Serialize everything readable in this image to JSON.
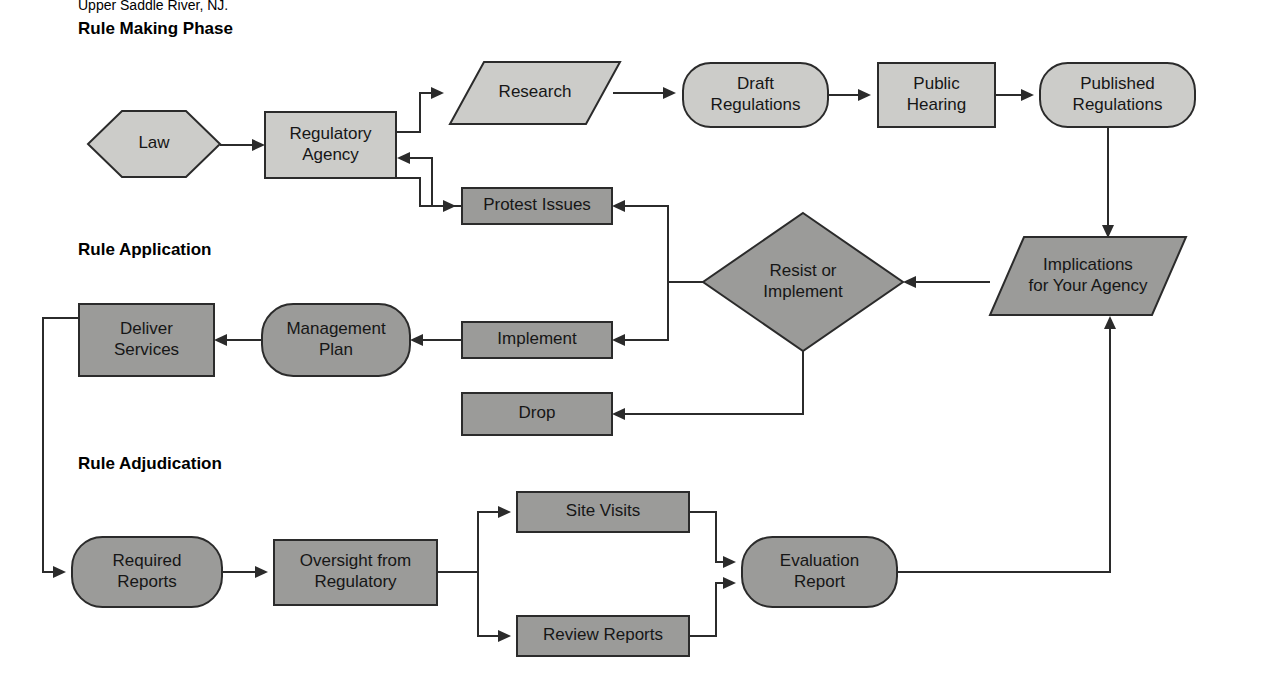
{
  "document": {
    "citation_line": "Upper Saddle River, NJ."
  },
  "sections": [
    {
      "id": "rule-making-phase",
      "label": "Rule Making Phase",
      "x": 78,
      "y": 34
    },
    {
      "id": "rule-application",
      "label": "Rule Application",
      "x": 78,
      "y": 255
    },
    {
      "id": "rule-adjudication",
      "label": "Rule Adjudication",
      "x": 78,
      "y": 469
    }
  ],
  "colors": {
    "fill_light": "#ccccc9",
    "fill_dark": "#9b9b99",
    "stroke": "#2b2b2b",
    "text": "#161616",
    "background": "#ffffff"
  },
  "nodes": [
    {
      "id": "law",
      "label": "Law",
      "lines": [
        "Law"
      ],
      "shape": "hexagon",
      "tone": "light",
      "x": 88,
      "y": 111,
      "w": 132,
      "h": 66
    },
    {
      "id": "regulatory-agency",
      "label": "Regulatory Agency",
      "lines": [
        "Regulatory",
        "Agency"
      ],
      "shape": "rect",
      "tone": "light",
      "x": 265,
      "y": 112,
      "w": 131,
      "h": 66
    },
    {
      "id": "research",
      "label": "Research",
      "lines": [
        "Research"
      ],
      "shape": "parallelogram",
      "tone": "light",
      "x": 450,
      "y": 62,
      "w": 170,
      "h": 62
    },
    {
      "id": "draft-regulations",
      "label": "Draft Regulations",
      "lines": [
        "Draft",
        "Regulations"
      ],
      "shape": "stadium",
      "tone": "light",
      "x": 683,
      "y": 63,
      "w": 145,
      "h": 64
    },
    {
      "id": "public-hearing",
      "label": "Public Hearing",
      "lines": [
        "Public",
        "Hearing"
      ],
      "shape": "rect",
      "tone": "light",
      "x": 878,
      "y": 63,
      "w": 117,
      "h": 64
    },
    {
      "id": "published-regulations",
      "label": "Published Regulations",
      "lines": [
        "Published",
        "Regulations"
      ],
      "shape": "stadium",
      "tone": "light",
      "x": 1040,
      "y": 63,
      "w": 155,
      "h": 64
    },
    {
      "id": "protest-issues",
      "label": "Protest Issues",
      "lines": [
        "Protest Issues"
      ],
      "shape": "rect",
      "tone": "dark",
      "x": 462,
      "y": 188,
      "w": 150,
      "h": 36
    },
    {
      "id": "resist-or-implement",
      "label": "Resist or Implement",
      "lines": [
        "Resist or",
        "Implement"
      ],
      "shape": "diamond",
      "tone": "dark",
      "x": 703,
      "y": 213,
      "w": 200,
      "h": 138
    },
    {
      "id": "implications",
      "label": "Implications for Your Agency",
      "lines": [
        "Implications",
        "for Your Agency"
      ],
      "shape": "parallelogram",
      "tone": "dark",
      "x": 990,
      "y": 237,
      "w": 196,
      "h": 78
    },
    {
      "id": "implement",
      "label": "Implement",
      "lines": [
        "Implement"
      ],
      "shape": "rect",
      "tone": "dark",
      "x": 462,
      "y": 322,
      "w": 150,
      "h": 36
    },
    {
      "id": "management-plan",
      "label": "Management Plan",
      "lines": [
        "Management",
        "Plan"
      ],
      "shape": "stadium",
      "tone": "dark",
      "x": 262,
      "y": 304,
      "w": 148,
      "h": 72
    },
    {
      "id": "deliver-services",
      "label": "Deliver Services",
      "lines": [
        "Deliver",
        "Services"
      ],
      "shape": "rect",
      "tone": "dark",
      "x": 79,
      "y": 304,
      "w": 135,
      "h": 72
    },
    {
      "id": "drop",
      "label": "Drop",
      "lines": [
        "Drop"
      ],
      "shape": "rect",
      "tone": "dark",
      "x": 462,
      "y": 393,
      "w": 150,
      "h": 42
    },
    {
      "id": "required-reports",
      "label": "Required Reports",
      "lines": [
        "Required",
        "Reports"
      ],
      "shape": "stadium",
      "tone": "dark",
      "x": 72,
      "y": 537,
      "w": 150,
      "h": 70
    },
    {
      "id": "oversight-regulatory",
      "label": "Oversight from Regulatory",
      "lines": [
        "Oversight from",
        "Regulatory"
      ],
      "shape": "rect",
      "tone": "dark",
      "x": 274,
      "y": 540,
      "w": 163,
      "h": 65
    },
    {
      "id": "site-visits",
      "label": "Site Visits",
      "lines": [
        "Site Visits"
      ],
      "shape": "rect",
      "tone": "dark",
      "x": 517,
      "y": 492,
      "w": 172,
      "h": 40
    },
    {
      "id": "review-reports",
      "label": "Review Reports",
      "lines": [
        "Review Reports"
      ],
      "shape": "rect",
      "tone": "dark",
      "x": 517,
      "y": 616,
      "w": 172,
      "h": 40
    },
    {
      "id": "evaluation-report",
      "label": "Evaluation Report",
      "lines": [
        "Evaluation",
        "Report"
      ],
      "shape": "stadium",
      "tone": "dark",
      "x": 742,
      "y": 537,
      "w": 155,
      "h": 70
    }
  ],
  "edges": [
    {
      "id": "law-to-agency",
      "from": "law",
      "to": "regulatory-agency",
      "path": "M 220 145 L 257 145",
      "arrow": "right",
      "ax": 265,
      "ay": 145
    },
    {
      "id": "agency-to-research",
      "from": "regulatory-agency",
      "to": "research",
      "path": "M 396 132 L 420 132 L 420 93 L 435 93",
      "arrow": "right",
      "ax": 444,
      "ay": 93
    },
    {
      "id": "research-to-draft",
      "from": "research",
      "to": "draft-regulations",
      "path": "M 613 93 L 667 93",
      "arrow": "right",
      "ax": 676,
      "ay": 93
    },
    {
      "id": "draft-to-hearing",
      "from": "draft-regulations",
      "to": "public-hearing",
      "path": "M 828 95 L 862 95",
      "arrow": "right",
      "ax": 871,
      "ay": 95
    },
    {
      "id": "hearing-to-published",
      "from": "public-hearing",
      "to": "published-regulations",
      "path": "M 995 95 L 1025 95",
      "arrow": "right",
      "ax": 1034,
      "ay": 95
    },
    {
      "id": "published-to-implications",
      "from": "published-regulations",
      "to": "implications",
      "path": "M 1108 127 L 1108 229",
      "arrow": "down",
      "ax": 1108,
      "ay": 238
    },
    {
      "id": "agency-to-protest",
      "from": "regulatory-agency",
      "to": "protest-issues",
      "path": "M 396 178 L 420 178 L 420 206 L 447 206",
      "arrow": "right",
      "ax": 456,
      "ay": 206
    },
    {
      "id": "protest-to-agency",
      "from": "protest-issues",
      "to": "regulatory-agency",
      "path": "M 462 206 L 432 206 L 432 158 L 406 158",
      "arrow": "left",
      "ax": 397,
      "ay": 158
    },
    {
      "id": "implications-to-diamond",
      "from": "implications",
      "to": "resist-or-implement",
      "path": "M 990 282 L 912 282",
      "arrow": "left",
      "ax": 903,
      "ay": 282
    },
    {
      "id": "diamond-to-protest",
      "from": "resist-or-implement",
      "to": "protest-issues",
      "path": "M 703 282 L 668 282 L 668 206 L 621 206",
      "arrow": "left",
      "ax": 612,
      "ay": 206
    },
    {
      "id": "diamond-to-implement",
      "from": "resist-or-implement",
      "to": "implement",
      "path": "M 668 282 L 668 340 L 621 340",
      "arrow": "left",
      "ax": 612,
      "ay": 340
    },
    {
      "id": "diamond-to-drop",
      "from": "resist-or-implement",
      "to": "drop",
      "path": "M 803 351 L 803 414 L 621 414",
      "arrow": "left",
      "ax": 612,
      "ay": 414
    },
    {
      "id": "implement-to-management",
      "from": "implement",
      "to": "management-plan",
      "path": "M 462 340 L 419 340",
      "arrow": "left",
      "ax": 410,
      "ay": 340
    },
    {
      "id": "management-to-deliver",
      "from": "management-plan",
      "to": "deliver-services",
      "path": "M 262 340 L 223 340",
      "arrow": "left",
      "ax": 214,
      "ay": 340
    },
    {
      "id": "deliver-to-required",
      "from": "deliver-services",
      "to": "required-reports",
      "path": "M 79 318 L 43 318 L 43 572 L 57 572",
      "arrow": "right",
      "ax": 66,
      "ay": 572
    },
    {
      "id": "required-to-oversight",
      "from": "required-reports",
      "to": "oversight-regulatory",
      "path": "M 222 572 L 259 572",
      "arrow": "right",
      "ax": 268,
      "ay": 572
    },
    {
      "id": "oversight-to-site-visits",
      "from": "oversight-regulatory",
      "to": "site-visits",
      "path": "M 437 572 L 478 572 L 478 512 L 502 512",
      "arrow": "right",
      "ax": 511,
      "ay": 512
    },
    {
      "id": "oversight-to-review-reports",
      "from": "oversight-regulatory",
      "to": "review-reports",
      "path": "M 478 572 L 478 636 L 502 636",
      "arrow": "right",
      "ax": 511,
      "ay": 636
    },
    {
      "id": "site-visits-to-evaluation",
      "from": "site-visits",
      "to": "evaluation-report",
      "path": "M 689 512 L 716 512 L 716 562 L 727 562",
      "arrow": "right",
      "ax": 736,
      "ay": 562
    },
    {
      "id": "review-reports-to-evaluation",
      "from": "review-reports",
      "to": "evaluation-report",
      "path": "M 689 636 L 716 636 L 716 583 L 727 583",
      "arrow": "right",
      "ax": 736,
      "ay": 583
    },
    {
      "id": "evaluation-to-implications",
      "from": "evaluation-report",
      "to": "implications",
      "path": "M 897 572 L 1110 572 L 1110 325",
      "arrow": "up",
      "ax": 1110,
      "ay": 316
    }
  ]
}
